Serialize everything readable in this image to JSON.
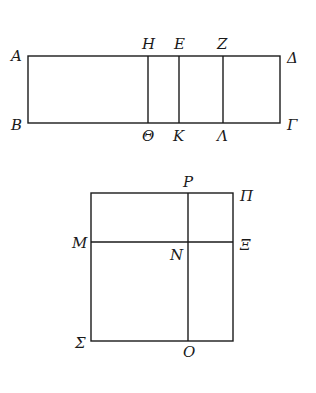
{
  "diagram": {
    "figure_1": {
      "labels": {
        "A": "A",
        "B": "B",
        "H": "H",
        "theta": "Θ",
        "E": "E",
        "K": "K",
        "Z": "Z",
        "Lambda": "Λ",
        "Delta": "Δ",
        "Gamma": "Γ"
      }
    },
    "figure_2": {
      "labels": {
        "P": "P",
        "Pi": "Π",
        "M": "M",
        "N": "N",
        "Xi": "Ξ",
        "Sigma": "Σ",
        "O": "O"
      }
    }
  }
}
